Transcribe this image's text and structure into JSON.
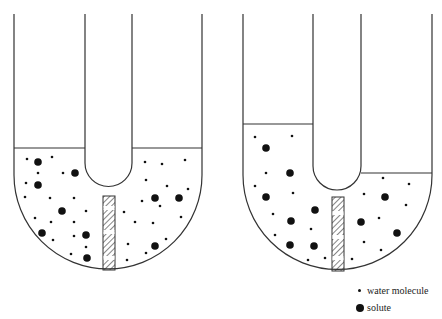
{
  "legend": {
    "items": [
      {
        "symbol": "small-dot",
        "label": "water molecule"
      },
      {
        "symbol": "large-dot",
        "label": "solute"
      }
    ]
  },
  "diagrams": [
    {
      "name": "initial-state",
      "left_level": "equal",
      "right_level": "equal",
      "membrane": "semipermeable"
    },
    {
      "name": "after-osmosis",
      "left_level": "higher",
      "right_level": "lower",
      "membrane": "semipermeable"
    }
  ]
}
